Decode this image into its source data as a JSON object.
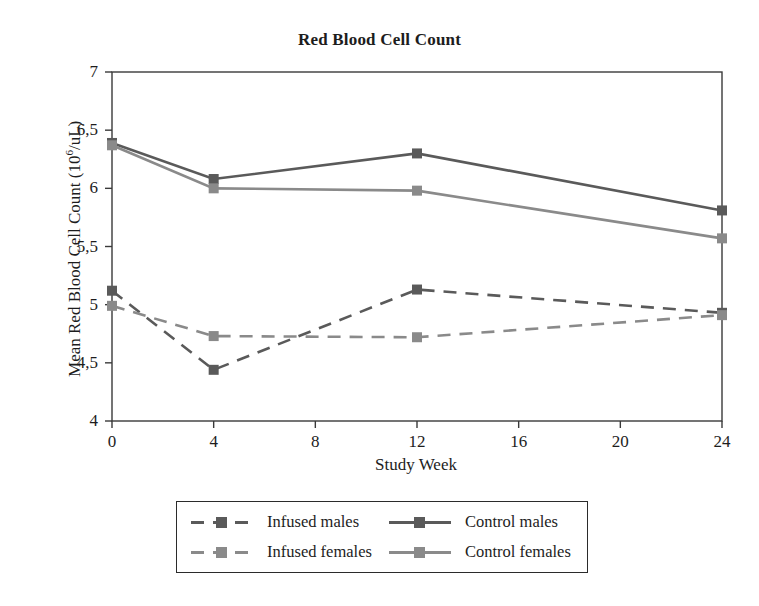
{
  "chart_data": {
    "type": "line",
    "title": "Red Blood Cell Count",
    "xlabel": "Study Week",
    "ylabel": "Mean Red Blood Cell Count (10⁶/uL)",
    "ylabel_main": "Mean Red Blood Cell Count (10",
    "ylabel_sup": "6",
    "ylabel_tail": "/uL)",
    "x": [
      0,
      4,
      12,
      24
    ],
    "xlim": [
      0,
      24
    ],
    "ylim": [
      4,
      7
    ],
    "xticks": [
      "0",
      "4",
      "8",
      "12",
      "16",
      "20",
      "24"
    ],
    "xtick_values": [
      0,
      4,
      8,
      12,
      16,
      20,
      24
    ],
    "yticks": [
      "7",
      "6,5",
      "6",
      "5,5",
      "5",
      "4,5",
      "4"
    ],
    "ytick_values": [
      7,
      6.5,
      6,
      5.5,
      5,
      4.5,
      4
    ],
    "decimal_separator": ",",
    "grid": false,
    "legend_position": "below-plot",
    "series": [
      {
        "name": "Infused males",
        "values": [
          5.12,
          4.44,
          5.13,
          4.93
        ],
        "line_style": "dashed",
        "color": "#5a5a5a",
        "marker": "square"
      },
      {
        "name": "Infused females",
        "values": [
          4.99,
          4.73,
          4.72,
          4.91
        ],
        "line_style": "dashed",
        "color": "#8a8a8a",
        "marker": "square"
      },
      {
        "name": "Control males",
        "values": [
          6.39,
          6.08,
          6.3,
          5.81
        ],
        "line_style": "solid",
        "color": "#5a5a5a",
        "marker": "square"
      },
      {
        "name": "Control females",
        "values": [
          6.37,
          6.0,
          5.98,
          5.57
        ],
        "line_style": "solid",
        "color": "#8a8a8a",
        "marker": "square"
      }
    ]
  },
  "legend": {
    "entries": [
      {
        "label": "Infused males",
        "series_index": 0
      },
      {
        "label": "Control males",
        "series_index": 2
      },
      {
        "label": "Infused females",
        "series_index": 1
      },
      {
        "label": "Control females",
        "series_index": 3
      }
    ]
  },
  "colors": {
    "axis": "#3a3a3a",
    "text": "#1d1d1d",
    "males": "#5a5a5a",
    "females": "#8a8a8a",
    "background": "#ffffff"
  }
}
